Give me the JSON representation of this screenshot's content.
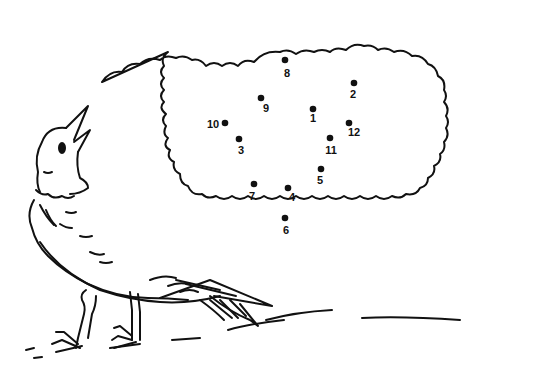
{
  "puzzle": {
    "type": "connect-the-dots",
    "ink_color": "#111111",
    "background_color": "#ffffff",
    "dots": [
      {
        "n": "1",
        "x": 313,
        "y": 109,
        "lx": 313,
        "ly": 122
      },
      {
        "n": "2",
        "x": 354,
        "y": 83,
        "lx": 353,
        "ly": 98
      },
      {
        "n": "3",
        "x": 239,
        "y": 139,
        "lx": 241,
        "ly": 154
      },
      {
        "n": "4",
        "x": 288,
        "y": 188,
        "lx": 292,
        "ly": 201
      },
      {
        "n": "5",
        "x": 321,
        "y": 169,
        "lx": 320,
        "ly": 184
      },
      {
        "n": "6",
        "x": 285,
        "y": 218,
        "lx": 286,
        "ly": 234
      },
      {
        "n": "7",
        "x": 254,
        "y": 184,
        "lx": 252,
        "ly": 200
      },
      {
        "n": "8",
        "x": 285,
        "y": 60,
        "lx": 287,
        "ly": 77
      },
      {
        "n": "9",
        "x": 261,
        "y": 98,
        "lx": 266,
        "ly": 112
      },
      {
        "n": "10",
        "x": 225,
        "y": 123,
        "lx": 213,
        "ly": 128
      },
      {
        "n": "11",
        "x": 330,
        "y": 138,
        "lx": 331,
        "ly": 154
      },
      {
        "n": "12",
        "x": 349,
        "y": 123,
        "lx": 354,
        "ly": 136
      }
    ]
  },
  "illustration": {
    "subject": "bird-looking-up",
    "bubble": "thought-cloud"
  }
}
